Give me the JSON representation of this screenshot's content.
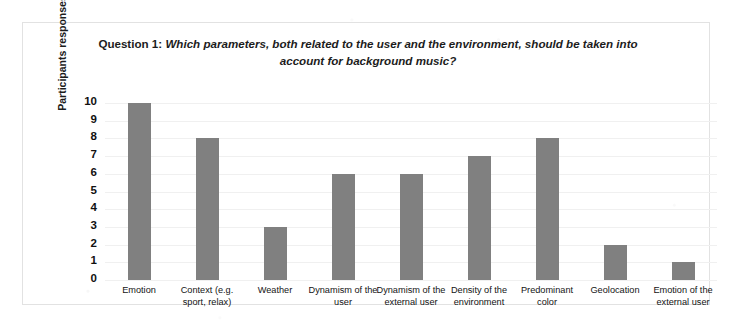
{
  "chart_data": {
    "type": "bar",
    "title_prefix": "Question 1",
    "title_separator": ":",
    "title": "Which parameters, both related to the user and the environment, should be taken into account for background music?",
    "xlabel": "",
    "ylabel": "Participants responses",
    "ylim": [
      0,
      10
    ],
    "ytick_labels": [
      "10",
      "9",
      "8",
      "7",
      "6",
      "5",
      "4",
      "3",
      "2",
      "1",
      "0"
    ],
    "grid": true,
    "legend": "none",
    "bar_color": "#808080",
    "categories": [
      "Emotion",
      "Context (e.g. sport, relax)",
      "Weather",
      "Dynamism of the user",
      "Dynamism of the external user",
      "Density of the environment",
      "Predominant color",
      "Geolocation",
      "Emotion of the external user"
    ],
    "values": [
      10,
      8,
      3,
      6,
      6,
      7,
      8,
      2,
      1
    ]
  }
}
